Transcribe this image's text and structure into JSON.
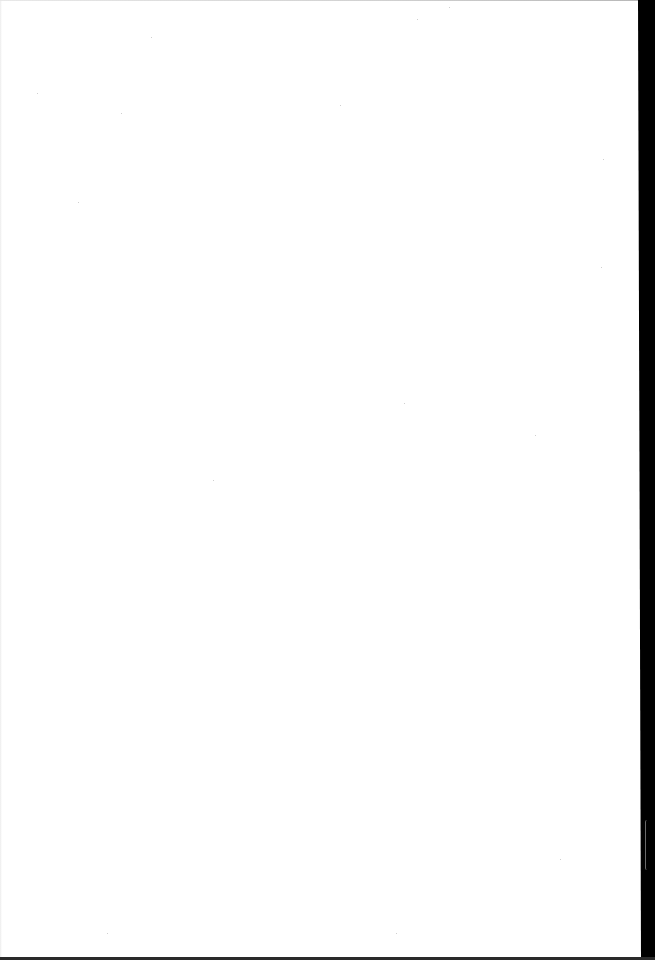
{
  "document": {
    "type": "blank scanned page",
    "content_text": "",
    "page_color": "#ffffff",
    "scanner_border_color": "#000000"
  }
}
